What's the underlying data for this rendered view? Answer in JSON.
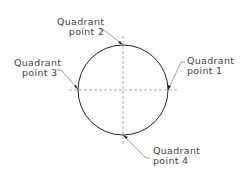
{
  "diagram": {
    "type": "circle-quadrant-points",
    "colors": {
      "circle": "#222222",
      "centerline": "#999999",
      "leader": "#888888",
      "text": "#444444"
    },
    "labels": [
      {
        "id": "q1",
        "line1": "Quadrant",
        "line2": "point  1"
      },
      {
        "id": "q2",
        "line1": "Quadrant",
        "line2": "point  2"
      },
      {
        "id": "q3",
        "line1": "Quadrant",
        "line2": "point  3"
      },
      {
        "id": "q4",
        "line1": "Quadrant",
        "line2": "point  4"
      }
    ]
  }
}
